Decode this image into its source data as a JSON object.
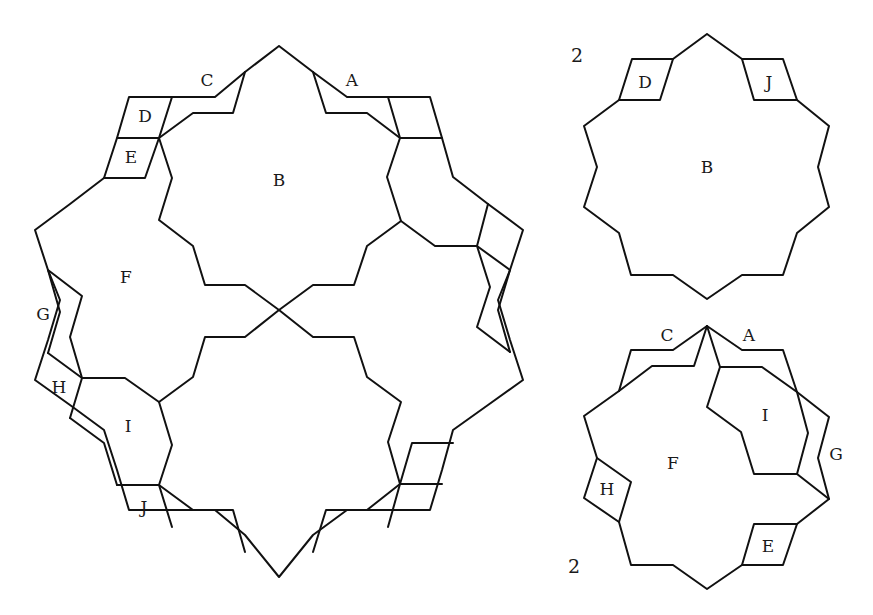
{
  "diagram": {
    "stroke_color": "#111111",
    "background": "#ffffff",
    "main_figure": {
      "labels": [
        {
          "text": "C",
          "x": 207,
          "y": 86
        },
        {
          "text": "A",
          "x": 352,
          "y": 86
        },
        {
          "text": "D",
          "x": 145,
          "y": 122
        },
        {
          "text": "E",
          "x": 131,
          "y": 163
        },
        {
          "text": "B",
          "x": 279,
          "y": 184
        },
        {
          "text": "F",
          "x": 126,
          "y": 281
        },
        {
          "text": "G",
          "x": 43,
          "y": 318
        },
        {
          "text": "H",
          "x": 59,
          "y": 391
        },
        {
          "text": "I",
          "x": 128,
          "y": 430
        },
        {
          "text": "J",
          "x": 144,
          "y": 511
        }
      ]
    },
    "top_right_figure": {
      "count_label": "2",
      "labels": [
        {
          "text": "D",
          "x": 645,
          "y": 87
        },
        {
          "text": "J",
          "x": 769,
          "y": 87
        },
        {
          "text": "B",
          "x": 707,
          "y": 172
        }
      ]
    },
    "bottom_right_figure": {
      "count_label": "2",
      "labels": [
        {
          "text": "C",
          "x": 667,
          "y": 339
        },
        {
          "text": "A",
          "x": 749,
          "y": 339
        },
        {
          "text": "I",
          "x": 765,
          "y": 419
        },
        {
          "text": "F",
          "x": 673,
          "y": 467
        },
        {
          "text": "G",
          "x": 836,
          "y": 458
        },
        {
          "text": "H",
          "x": 607,
          "y": 493
        },
        {
          "text": "E",
          "x": 768,
          "y": 550
        }
      ]
    }
  }
}
